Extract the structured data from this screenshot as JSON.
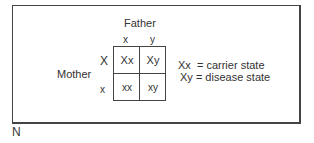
{
  "diagram": {
    "father_label": "Father",
    "mother_label": "Mother",
    "father_alleles": [
      "x",
      "y"
    ],
    "mother_alleles": [
      "X",
      "x"
    ],
    "cells": [
      [
        "Xx",
        "Xy"
      ],
      [
        "xx",
        "xy"
      ]
    ],
    "legend": [
      "Xx  = carrier state",
      "Xy = disease state"
    ],
    "figure_letter": "N"
  }
}
